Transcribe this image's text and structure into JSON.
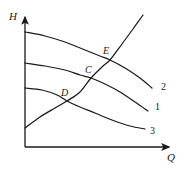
{
  "figure": {
    "background_color": "#ffffff",
    "line_color": "#1a1a1a"
  },
  "axes": {
    "y_label": "H",
    "x_label": "Q",
    "origin_px": [
      25,
      147
    ],
    "x_axis_end_px": [
      172,
      147
    ],
    "y_axis_end_px": [
      25,
      14
    ]
  },
  "labels": {
    "point_E": "E",
    "point_C": "C",
    "point_D": "D",
    "curve_2": "2",
    "curve_1": "1",
    "curve_3": "3"
  },
  "chart_data": {
    "type": "line",
    "title": "",
    "xlabel": "Q",
    "ylabel": "H",
    "grid": false,
    "legend": "curve-end-labels",
    "axis_arrows": true,
    "series": [
      {
        "name": "2",
        "role": "pump-head-curve-upper",
        "label": "2",
        "label_px": [
          161,
          82
        ],
        "points_px": [
          [
            25,
            32
          ],
          [
            45,
            36
          ],
          [
            65,
            42
          ],
          [
            85,
            50
          ],
          [
            100,
            56
          ],
          [
            110,
            60
          ],
          [
            125,
            68
          ],
          [
            140,
            78
          ],
          [
            152,
            88
          ]
        ]
      },
      {
        "name": "1",
        "role": "pump-head-curve-middle",
        "label": "1",
        "label_px": [
          155,
          102
        ],
        "points_px": [
          [
            25,
            63
          ],
          [
            45,
            66
          ],
          [
            65,
            70
          ],
          [
            80,
            75
          ],
          [
            91,
            78
          ],
          [
            105,
            84
          ],
          [
            120,
            92
          ],
          [
            135,
            102
          ],
          [
            148,
            111
          ]
        ]
      },
      {
        "name": "3",
        "role": "pump-head-curve-lower",
        "label": "3",
        "label_px": [
          150,
          126
        ],
        "points_px": [
          [
            25,
            88
          ],
          [
            42,
            90
          ],
          [
            57,
            95
          ],
          [
            67,
            101
          ],
          [
            80,
            107
          ],
          [
            95,
            113
          ],
          [
            112,
            120
          ],
          [
            130,
            126
          ],
          [
            145,
            129
          ]
        ]
      },
      {
        "name": "system-resistance",
        "role": "pipeline-resistance-curve",
        "label": "",
        "points_px": [
          [
            25,
            128
          ],
          [
            40,
            117
          ],
          [
            55,
            108
          ],
          [
            67,
            101
          ],
          [
            80,
            92
          ],
          [
            91,
            78
          ],
          [
            103,
            66
          ],
          [
            110,
            60
          ],
          [
            122,
            44
          ],
          [
            133,
            29
          ],
          [
            143,
            15
          ]
        ]
      }
    ],
    "intersections": [
      {
        "label": "E",
        "between": [
          "2",
          "system-resistance"
        ],
        "px": [
          110,
          60
        ]
      },
      {
        "label": "C",
        "between": [
          "1",
          "system-resistance"
        ],
        "px": [
          91,
          78
        ]
      },
      {
        "label": "D",
        "between": [
          "3",
          "system-resistance"
        ],
        "px": [
          67,
          101
        ]
      }
    ]
  }
}
